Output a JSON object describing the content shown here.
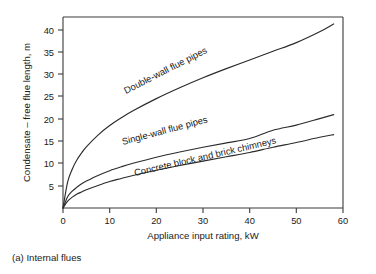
{
  "figure": {
    "caption": "(a) Internal flues"
  },
  "chart_data": {
    "type": "line",
    "title": "",
    "subtitle": "",
    "xlabel": "Appliance input rating, kW",
    "ylabel": "Condensate – free flue length, m",
    "xlim": [
      0,
      60
    ],
    "ylim": [
      0,
      44
    ],
    "xticks": [
      0,
      10,
      20,
      30,
      40,
      50,
      60
    ],
    "xticklabels": [
      "0",
      "10",
      "20",
      "30",
      "40",
      "50",
      "60"
    ],
    "yticks": [
      5,
      10,
      15,
      20,
      25,
      30,
      35,
      40
    ],
    "yticklabels": [
      "5",
      "10",
      "15",
      "20",
      "25",
      "30",
      "35",
      "40"
    ],
    "grid": false,
    "legend_position": "inline-curve-labels",
    "x": [
      0,
      1,
      2,
      3,
      4,
      5,
      7.5,
      10,
      12.5,
      15,
      20,
      25,
      30,
      35,
      40,
      45,
      50,
      55,
      58
    ],
    "series": [
      {
        "name": "Double-wall flue pipes",
        "label": "Double-wall flue pipes",
        "label_angle_deg": -27,
        "values": [
          0,
          6.0,
          9.0,
          11.1,
          12.7,
          14.1,
          16.8,
          19.0,
          20.8,
          22.4,
          25.2,
          27.7,
          30.0,
          32.1,
          34.1,
          36.1,
          38.1,
          40.6,
          42.4
        ],
        "endpoint": {
          "x": 58,
          "y": 42.4
        }
      },
      {
        "name": "Single-wall flue pipes",
        "label": "Single-wall flue pipes",
        "label_angle_deg": -15,
        "values": [
          0,
          2.6,
          3.9,
          4.8,
          5.6,
          6.2,
          7.5,
          8.6,
          9.5,
          10.3,
          11.7,
          12.9,
          14.0,
          15.0,
          16.0,
          17.9,
          19.1,
          20.6,
          21.5
        ],
        "endpoint": {
          "x": 58,
          "y": 21.5
        }
      },
      {
        "name": "Concrete block and brick chimneys",
        "label": "Concrete block and brick chimneys",
        "label_angle_deg": -13,
        "values": [
          0,
          1.6,
          2.5,
          3.2,
          3.7,
          4.2,
          5.2,
          6.1,
          6.8,
          7.5,
          8.7,
          9.8,
          10.8,
          11.8,
          12.8,
          14.0,
          15.1,
          16.3,
          16.9
        ],
        "endpoint": {
          "x": 58,
          "y": 16.9
        }
      }
    ],
    "annotations": [
      {
        "text": "Double-wall flue pipes",
        "x": 13.5,
        "y": 25.5
      },
      {
        "text": "Single-wall flue pipes",
        "x": 13.0,
        "y": 14.4
      },
      {
        "text": "Concrete block and brick chimneys",
        "x": 15.5,
        "y": 9.6
      }
    ],
    "colors": {
      "curve": "#2b2b2b",
      "axis": "#3a3a3a",
      "text": "#1a1a1a",
      "background": "#ffffff"
    }
  }
}
